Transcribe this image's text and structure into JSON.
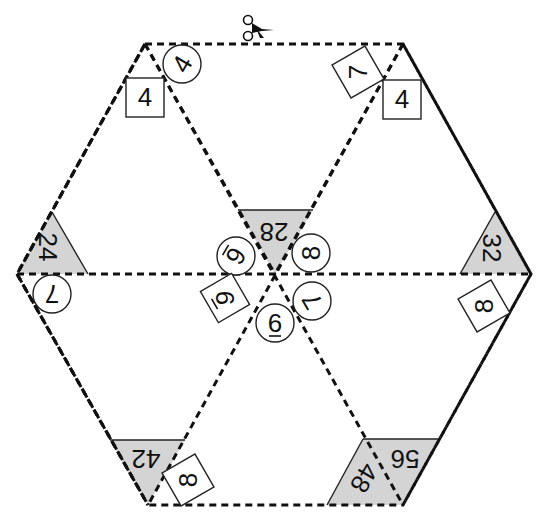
{
  "puzzle": {
    "type": "hexagon-triangle-matching-puzzle",
    "cut_icon": "scissors-icon",
    "colors": {
      "line": "#111111",
      "gray_fill": "#d4d4d4",
      "background": "#ffffff"
    },
    "gray_triangles": [
      {
        "id": "top-center",
        "value": "28"
      },
      {
        "id": "left",
        "value": "24"
      },
      {
        "id": "right",
        "value": "32"
      },
      {
        "id": "bottom-left",
        "value": "42"
      },
      {
        "id": "bottom-right-a",
        "value": "56"
      },
      {
        "id": "bottom-right-b",
        "value": "48"
      }
    ],
    "circles": [
      {
        "id": "top-left",
        "value": "4"
      },
      {
        "id": "left",
        "value": "7"
      },
      {
        "id": "center-upper-left",
        "value": "6"
      },
      {
        "id": "center-upper-right",
        "value": "8"
      },
      {
        "id": "center-lower-right",
        "value": "7"
      },
      {
        "id": "center-bottom",
        "value": "6"
      }
    ],
    "squares": [
      {
        "id": "top-left",
        "value": "4"
      },
      {
        "id": "top-right-rotated",
        "value": "7"
      },
      {
        "id": "top-right",
        "value": "4"
      },
      {
        "id": "center-left",
        "value": "9"
      },
      {
        "id": "right",
        "value": "8"
      },
      {
        "id": "bottom-left",
        "value": "8"
      }
    ]
  }
}
